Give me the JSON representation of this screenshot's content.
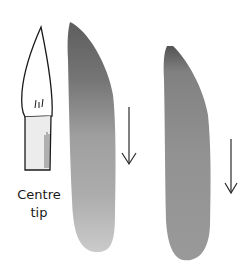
{
  "illustration": {
    "brush_label_line1": "Centre",
    "brush_label_line2": "tip",
    "strokes": [
      {
        "name": "left-stroke",
        "dark_color": "#5a5a5a",
        "light_color": "#c4c4c4",
        "direction": "down"
      },
      {
        "name": "right-stroke",
        "dark_color": "#4e4e4e",
        "light_color": "#8e8e8e",
        "direction": "down"
      }
    ],
    "arrow_color": "#2a2a2a",
    "outline_color": "#1a1a1a"
  }
}
